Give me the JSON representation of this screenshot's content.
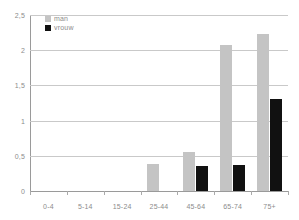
{
  "chart_data": {
    "type": "bar",
    "title": "",
    "subtitle": "",
    "xlabel": "",
    "ylabel": "",
    "ylim": [
      0,
      2.5
    ],
    "yticks": [
      0,
      0.5,
      1,
      1.5,
      2,
      2.5
    ],
    "ytick_labels": [
      "0",
      "0,5",
      "1",
      "1,5",
      "2",
      "2,5"
    ],
    "grid": true,
    "legend_position": "top-left",
    "categories": [
      "0-4",
      "5-14",
      "15-24",
      "25-44",
      "45-64",
      "65-74",
      "75+"
    ],
    "series": [
      {
        "name": "man",
        "color": "#c4c4c4",
        "values": [
          0,
          0,
          0,
          0.39,
          0.55,
          2.08,
          2.23
        ]
      },
      {
        "name": "vrouw",
        "color": "#111111",
        "values": [
          0,
          0,
          0,
          0,
          0.35,
          0.37,
          1.3
        ]
      }
    ]
  },
  "legend": {
    "entries": [
      {
        "label": "man"
      },
      {
        "label": "vrouw"
      }
    ]
  },
  "colors": {
    "series_man": "#c4c4c4",
    "series_vrouw": "#111111",
    "gridline": "#c9c9c9",
    "axis": "#9a9a9a",
    "tick_text": "#8c8c8c",
    "background": "#ffffff"
  }
}
